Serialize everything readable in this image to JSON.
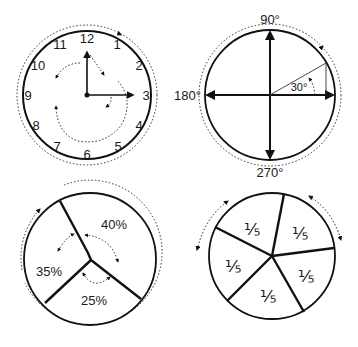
{
  "diagrams": {
    "clock": {
      "numbers": [
        "12",
        "1",
        "2",
        "3",
        "4",
        "5",
        "6",
        "7",
        "8",
        "9",
        "10",
        "11"
      ],
      "hour_hand_points_to": "12",
      "minute_hand_points_to": "3"
    },
    "angle_circle": {
      "labels": {
        "top": "90°",
        "left": "180°",
        "bottom": "270°"
      },
      "angle_label": "30°"
    },
    "percent_pie": {
      "segments": [
        {
          "label": "40%",
          "value": 40
        },
        {
          "label": "35%",
          "value": 35
        },
        {
          "label": "25%",
          "value": 25
        }
      ]
    },
    "fifths_pie": {
      "segments": [
        {
          "label": "⅕"
        },
        {
          "label": "⅕"
        },
        {
          "label": "⅕"
        },
        {
          "label": "⅕"
        },
        {
          "label": "⅕"
        }
      ]
    }
  },
  "colors": {
    "stroke": "#111111",
    "background": "#ffffff"
  }
}
